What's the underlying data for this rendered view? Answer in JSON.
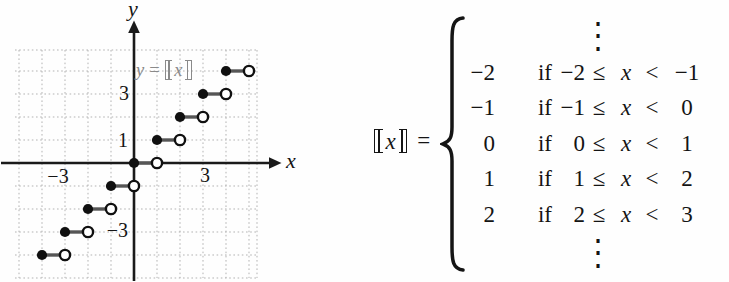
{
  "graph": {
    "x_axis_letter": "x",
    "y_axis_letter": "y",
    "x_tick_labels": [
      {
        "text": "−3",
        "value": -3
      },
      {
        "text": "3",
        "value": 3
      }
    ],
    "y_tick_labels": [
      {
        "text": "3",
        "value": 3
      },
      {
        "text": "1",
        "value": 1
      },
      {
        "text": "−3",
        "value": -3
      }
    ],
    "curve_label": {
      "lhs": "y",
      "equals": "=",
      "var": "x",
      "full": "y = ⟦x⟧"
    },
    "colors": {
      "curve_label": "#8a8a8a",
      "grid": "#b3b3b3",
      "axis": "#1a1a1a",
      "step_segment": "#565656",
      "point_fill": "#101010",
      "open_point_fill": "#ffffff"
    }
  },
  "chart_data": {
    "type": "line",
    "subtype": "step",
    "xlabel": "x",
    "ylabel": "y",
    "xlim": [
      -5.2,
      5.4
    ],
    "ylim": [
      -5.2,
      4.9
    ],
    "grid": true,
    "legend": false,
    "labeled_x_ticks": [
      -3,
      3
    ],
    "labeled_y_ticks": [
      3,
      1,
      -3
    ],
    "series": [
      {
        "name": "y = ⟦x⟧ (greatest integer / floor function)",
        "endpoint_rule": "closed dot at left endpoint x = n, open circle at right endpoint x = n + 1",
        "segments": [
          {
            "y": -4,
            "x_from": -4,
            "x_to": -3,
            "left_endpoint": "closed",
            "right_endpoint": "open"
          },
          {
            "y": -3,
            "x_from": -3,
            "x_to": -2,
            "left_endpoint": "closed",
            "right_endpoint": "open"
          },
          {
            "y": -2,
            "x_from": -2,
            "x_to": -1,
            "left_endpoint": "closed",
            "right_endpoint": "open"
          },
          {
            "y": -1,
            "x_from": -1,
            "x_to": 0,
            "left_endpoint": "closed",
            "right_endpoint": "open"
          },
          {
            "y": 0,
            "x_from": 0,
            "x_to": 1,
            "left_endpoint": "closed",
            "right_endpoint": "open"
          },
          {
            "y": 1,
            "x_from": 1,
            "x_to": 2,
            "left_endpoint": "closed",
            "right_endpoint": "open"
          },
          {
            "y": 2,
            "x_from": 2,
            "x_to": 3,
            "left_endpoint": "closed",
            "right_endpoint": "open"
          },
          {
            "y": 3,
            "x_from": 3,
            "x_to": 4,
            "left_endpoint": "closed",
            "right_endpoint": "open"
          },
          {
            "y": 4,
            "x_from": 4,
            "x_to": 5,
            "left_endpoint": "closed",
            "right_endpoint": "open"
          }
        ]
      }
    ]
  },
  "equation": {
    "lhs_var": "x",
    "lhs_full": "⟦x⟧",
    "equals": "=",
    "ellipsis": "⋮",
    "if_word": "if",
    "leq": "≤",
    "lt": "<",
    "var": "x",
    "rows": [
      {
        "value": "−2",
        "lower": "−2",
        "upper": "−1"
      },
      {
        "value": "−1",
        "lower": "−1",
        "upper": "0"
      },
      {
        "value": "0",
        "lower": "0",
        "upper": "1"
      },
      {
        "value": "1",
        "lower": "1",
        "upper": "2"
      },
      {
        "value": "2",
        "lower": "2",
        "upper": "3"
      }
    ]
  }
}
